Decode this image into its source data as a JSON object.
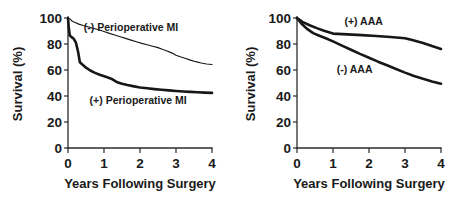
{
  "figure": {
    "background": "#ffffff",
    "ink_color": "#17171a",
    "panel_count": 2
  },
  "chart_data": [
    {
      "panel": "left",
      "type": "line",
      "title": "",
      "xlabel": "Years Following Surgery",
      "ylabel": "Survival (%)",
      "xlim": [
        0,
        4
      ],
      "ylim": [
        0,
        100
      ],
      "xticks": [
        0,
        1,
        2,
        3,
        4
      ],
      "xticklabels": [
        "0",
        "1",
        "2",
        "3",
        "4"
      ],
      "yticks": [
        0,
        20,
        40,
        60,
        80,
        100
      ],
      "yticklabels": [
        "0",
        "20",
        "40",
        "60",
        "80",
        "100"
      ],
      "grid": false,
      "legend_position": "inline-annotations",
      "series": [
        {
          "name": "(-) Perioperative MI",
          "label_x": 1.75,
          "label_y": 90,
          "linewidth": "thin",
          "x": [
            0.0,
            0.05,
            0.12,
            0.2,
            0.3,
            0.42,
            0.55,
            0.7,
            0.85,
            1.0,
            1.15,
            1.3,
            1.45,
            1.6,
            1.75,
            1.9,
            2.05,
            2.2,
            2.35,
            2.5,
            2.62,
            2.75,
            2.88,
            3.0,
            3.12,
            3.25,
            3.4,
            3.55,
            3.7,
            3.85,
            4.0
          ],
          "y": [
            100.0,
            99.3,
            97.5,
            96.6,
            95.3,
            94.2,
            93.3,
            92.1,
            91.0,
            89.6,
            88.2,
            86.9,
            85.6,
            84.3,
            83.0,
            81.7,
            80.5,
            79.4,
            78.3,
            77.2,
            75.9,
            74.6,
            73.2,
            71.4,
            70.2,
            69.0,
            67.6,
            66.4,
            65.4,
            64.6,
            64.2
          ]
        },
        {
          "name": "(+) Perioperative MI",
          "label_x": 1.95,
          "label_y": 34,
          "linewidth": "thick",
          "x": [
            0.0,
            0.02,
            0.05,
            0.1,
            0.16,
            0.22,
            0.28,
            0.33,
            0.4,
            0.5,
            0.62,
            0.75,
            0.9,
            1.05,
            1.2,
            1.35,
            1.5,
            1.65,
            1.8,
            2.0,
            2.2,
            2.4,
            2.6,
            2.8,
            3.0,
            3.2,
            3.4,
            3.6,
            3.8,
            4.0
          ],
          "y": [
            100.0,
            93.0,
            86.5,
            85.3,
            84.0,
            81.0,
            74.0,
            66.0,
            64.2,
            61.8,
            59.6,
            57.8,
            56.2,
            54.8,
            53.3,
            50.8,
            49.4,
            48.4,
            47.6,
            46.6,
            45.9,
            45.3,
            44.8,
            44.3,
            43.9,
            43.5,
            43.2,
            42.9,
            42.6,
            42.4
          ]
        }
      ]
    },
    {
      "panel": "right",
      "type": "line",
      "title": "",
      "xlabel": "Years Following Surgery",
      "ylabel": "Survival (%)",
      "xlim": [
        0,
        4
      ],
      "ylim": [
        0,
        100
      ],
      "xticks": [
        0,
        1,
        2,
        3,
        4
      ],
      "xticklabels": [
        "0",
        "1",
        "2",
        "3",
        "4"
      ],
      "yticks": [
        0,
        20,
        40,
        60,
        80,
        100
      ],
      "yticklabels": [
        "0",
        "20",
        "40",
        "60",
        "80",
        "100"
      ],
      "grid": false,
      "legend_position": "inline-annotations",
      "series": [
        {
          "name": "(+) AAA",
          "label_x": 1.85,
          "label_y": 95,
          "linewidth": "thick",
          "x": [
            0.0,
            0.15,
            0.35,
            0.55,
            0.75,
            1.0,
            1.4,
            1.8,
            2.2,
            2.6,
            3.0,
            3.2,
            3.5,
            3.75,
            4.0
          ],
          "y": [
            100.0,
            97.0,
            94.4,
            92.2,
            90.2,
            88.0,
            87.4,
            86.8,
            86.2,
            85.4,
            84.4,
            83.0,
            80.8,
            78.4,
            76.2
          ]
        },
        {
          "name": "(-) AAA",
          "label_x": 1.6,
          "label_y": 58,
          "linewidth": "thick",
          "x": [
            0.0,
            0.12,
            0.28,
            0.45,
            0.62,
            0.8,
            1.0,
            1.25,
            1.5,
            1.75,
            2.0,
            2.25,
            2.5,
            2.75,
            3.0,
            3.25,
            3.5,
            3.75,
            4.0
          ],
          "y": [
            100.0,
            95.8,
            91.6,
            88.4,
            86.4,
            84.4,
            82.0,
            78.8,
            75.6,
            72.4,
            69.4,
            66.4,
            63.6,
            60.8,
            58.0,
            55.4,
            53.2,
            51.2,
            49.4
          ]
        }
      ]
    }
  ],
  "panels": {
    "left": {
      "y_axis_title": "Survival (%)",
      "x_axis_title": "Years Following Surgery",
      "y_tick_labels": [
        "100",
        "80",
        "60",
        "40",
        "20",
        "0"
      ],
      "x_tick_labels": [
        "0",
        "1",
        "2",
        "3",
        "4"
      ],
      "annotation_upper": "(-) Perioperative MI",
      "annotation_lower": "(+) Perioperative MI"
    },
    "right": {
      "y_axis_title": "Survival (%)",
      "x_axis_title": "Years Following Surgery",
      "y_tick_labels": [
        "100",
        "80",
        "60",
        "40",
        "20",
        "0"
      ],
      "x_tick_labels": [
        "0",
        "1",
        "2",
        "3",
        "4"
      ],
      "annotation_upper": "(+) AAA",
      "annotation_lower": "(-) AAA"
    }
  }
}
